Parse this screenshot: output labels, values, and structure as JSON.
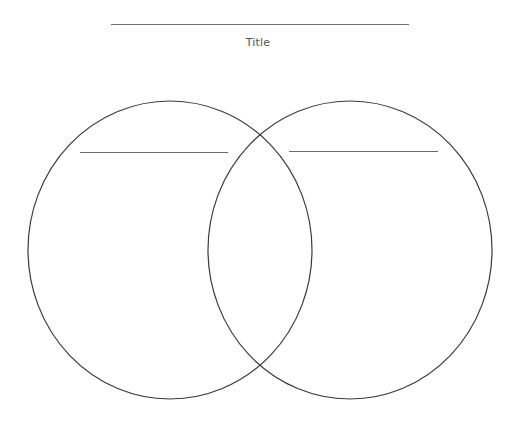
{
  "diagram": {
    "type": "venn",
    "title": {
      "label": "Title",
      "line_color": "#6e6e6e",
      "text_color": "#555555"
    },
    "circles": [
      {
        "name": "left-set",
        "heading": "",
        "center": [
          170,
          250
        ],
        "rx": 142,
        "ry": 149,
        "stroke": "#3a3a3a"
      },
      {
        "name": "right-set",
        "heading": "",
        "center": [
          350,
          250
        ],
        "rx": 142,
        "ry": 149,
        "stroke": "#3a3a3a"
      }
    ],
    "regions": {
      "left_only": "",
      "overlap": "",
      "right_only": ""
    }
  }
}
